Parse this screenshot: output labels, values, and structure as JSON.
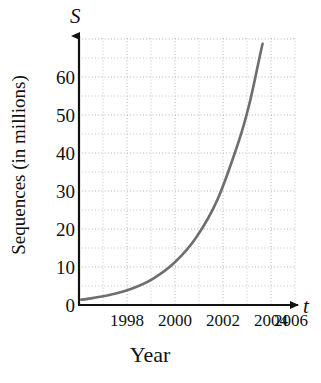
{
  "figure": {
    "axis_variable_y": "S",
    "axis_variable_x": "t",
    "ylabel": "Sequences (in millions)",
    "xlabel": "Year"
  },
  "chart_data": {
    "type": "line",
    "title": "",
    "subtitle": "",
    "xlabel": "Year",
    "ylabel": "Sequences (in millions)",
    "axis_variable_x": "t",
    "axis_variable_y": "S",
    "xlim": [
      1996.6,
      2006.6
    ],
    "ylim": [
      0,
      70
    ],
    "xticks": [
      1998,
      2000,
      2002,
      2004,
      2006
    ],
    "xticklabels": [
      "1998",
      "2000",
      "2002",
      "2004",
      "2006"
    ],
    "yticks": [
      0,
      10,
      20,
      30,
      40,
      50,
      60
    ],
    "yticklabels": [
      "0",
      "10",
      "20",
      "30",
      "40",
      "50",
      "60"
    ],
    "x_minor_step": 1,
    "y_minor_step": 5,
    "grid": true,
    "grid_style": "dotted",
    "grid_color": "#b9b9b9",
    "legend": false,
    "legend_position": "none",
    "line_color": "#6e6e6e",
    "line_width": 2.6,
    "series": [
      {
        "name": "Sequences",
        "x": [
          1996.7,
          1997,
          1998,
          1999,
          2000,
          2001,
          2002,
          2003,
          2004,
          2004.5,
          2005,
          2005.1
        ],
        "values": [
          1.4,
          1.6,
          2.6,
          4.2,
          6.8,
          11.0,
          17.5,
          27.5,
          43.0,
          53.0,
          66.0,
          68.5
        ]
      }
    ],
    "annotations": []
  },
  "colors": {
    "axis": "#111111",
    "curve": "#6e6e6e",
    "grid": "#b9b9b9",
    "background": "#ffffff",
    "text": "#111111"
  }
}
